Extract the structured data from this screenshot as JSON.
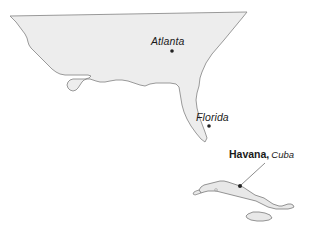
{
  "figure": {
    "type": "reference-map",
    "background_color": "#ffffff",
    "width": 318,
    "height": 237
  },
  "style": {
    "land_fill": "#ededed",
    "land_stroke": "#8f8f8f",
    "island_fill": "#e8e8e8",
    "island_stroke": "#7a7a7a",
    "marker_color": "#222222",
    "leader_line_color": "#707070",
    "text_color": "#1a1a1a"
  },
  "labels": {
    "atlanta": "Atlanta",
    "florida": "Florida",
    "havana_city": "Havana,",
    "cuba_country": "Cuba"
  },
  "markers": [
    {
      "name": "atlanta",
      "x": 172,
      "y": 51
    },
    {
      "name": "florida",
      "x": 209,
      "y": 126
    },
    {
      "name": "havana",
      "x": 240,
      "y": 186
    }
  ],
  "shapes": {
    "mainland_us": "M 10,16 L 247,12 L 243,17 L 224,40 L 212,54 L 206,63 L 202,72 L 200,78 L 199,86 L 197,93 L 196,100 L 197,108 L 199,116 L 202,124 L 205,132 L 207,138 L 205,142 L 201,139 L 196,133 L 191,126 L 187,119 L 184,112 L 182,105 L 181,99 L 180,93 L 179,87 L 176,84 L 170,83 L 163,83 L 156,83 L 150,84 L 145,86 L 140,85 L 134,83 L 128,81 L 122,80 L 116,80 L 110,81 L 105,82 L 100,82 L 96,81 L 93,80 L 90,79 L 87,79 L 84,80 L 82,82 L 80,85 L 78,88 L 76,90 L 73,91 L 70,90 L 68,88 L 67,85 L 68,82 L 70,80 L 73,79 L 77,79 L 81,79 L 85,79 L 89,78 L 91,76 L 88,75 L 83,75 L 77,75 L 71,75 L 65,75 L 60,74 L 56,72 L 52,69 L 49,66 L 46,63 L 43,60 L 40,57 L 37,54 L 34,51 L 31,48 L 29,45 L 28,42 L 27,38 L 25,34 L 22,30 L 19,26 L 16,22 L 13,19 Z",
    "cuba_main": "M 199,190 L 201,187 L 204,185 L 208,184 L 212,183 L 216,182 L 220,181 L 224,181 L 228,182 L 231,183 L 234,184 L 237,185 L 240,186 L 243,187 L 246,189 L 249,191 L 252,193 L 255,195 L 258,196 L 261,197 L 264,198 L 267,200 L 270,202 L 273,204 L 276,205 L 279,206 L 282,206 L 285,205 L 288,204 L 291,204 L 293,205 L 294,207 L 292,208 L 288,209 L 284,209 L 280,209 L 276,209 L 272,208 L 268,207 L 264,205 L 260,203 L 256,201 L 252,200 L 248,199 L 244,198 L 240,197 L 236,196 L 232,195 L 228,194 L 224,193 L 220,192 L 216,191 L 212,191 L 208,191 L 204,192 L 201,193 Z",
    "cuba_west_tip": "M 199,190 L 196,191 L 194,192 L 193,194 L 195,195 L 198,194 L 201,193 Z",
    "isla_juventud": "M 248,214 L 253,212 L 259,212 L 265,213 L 270,215 L 272,218 L 269,220 L 263,221 L 257,221 L 251,220 L 247,218 L 246,216 Z",
    "leader_line": "M 265,163 L 241,185"
  }
}
